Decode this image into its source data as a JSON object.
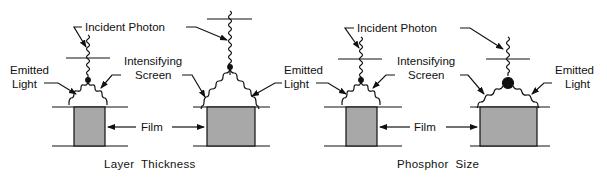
{
  "labels": {
    "incident_photon": "Incident Photon",
    "intensifying_line1": "Intensifying",
    "intensifying_line2": "Screen",
    "emitted_line1": "Emitted",
    "emitted_line2": "Light",
    "film": "Film"
  },
  "captions": {
    "left": "Layer  Thickness",
    "right": "Phosphor  Size"
  },
  "colors": {
    "film_fill": "#a8a8a8",
    "line": "#111111"
  },
  "panels": [
    {
      "id": "thin-layer",
      "group": "Layer Thickness"
    },
    {
      "id": "thick-layer",
      "group": "Layer Thickness"
    },
    {
      "id": "small-phosphor",
      "group": "Phosphor Size"
    },
    {
      "id": "large-phosphor",
      "group": "Phosphor Size"
    }
  ]
}
